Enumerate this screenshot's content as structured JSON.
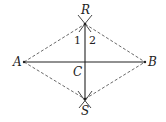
{
  "diagram": {
    "type": "geometric-construction",
    "colors": {
      "stroke": "#333333",
      "background": "#ffffff"
    },
    "points": {
      "R": {
        "label": "R",
        "x": 85,
        "y": 24
      },
      "S": {
        "label": "S",
        "x": 85,
        "y": 99
      },
      "A": {
        "label": "A",
        "x": 24,
        "y": 62
      },
      "B": {
        "label": "B",
        "x": 145,
        "y": 62
      },
      "C": {
        "label": "C",
        "x": 85,
        "y": 62
      }
    },
    "angle_labels": {
      "angle1": "1",
      "angle2": "2"
    },
    "solid_segments": [
      "AB",
      "RS"
    ],
    "dashed_segments": [
      "AR",
      "RB",
      "AS",
      "SB"
    ],
    "arc_marks": [
      "R",
      "S"
    ]
  }
}
